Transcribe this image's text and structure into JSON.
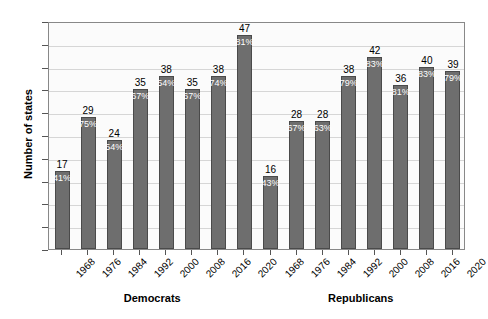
{
  "chart_data": {
    "type": "bar",
    "title": "",
    "xlabel": "",
    "ylabel": "Number of states",
    "ylim": [
      0,
      50
    ],
    "ytick_step": 5,
    "yticks": [
      0,
      5,
      10,
      15,
      20,
      25,
      30,
      35,
      40,
      45,
      50
    ],
    "grid": true,
    "legend": "none",
    "groups": [
      "Democrats",
      "Republicans"
    ],
    "categories": [
      "1968",
      "1976",
      "1984",
      "1992",
      "2000",
      "2008",
      "2016",
      "2020",
      "1968",
      "1976",
      "1984",
      "1992",
      "2000",
      "2008",
      "2016",
      "2020"
    ],
    "values": [
      17,
      29,
      24,
      35,
      38,
      35,
      38,
      47,
      16,
      28,
      28,
      38,
      42,
      36,
      40,
      39
    ],
    "data_labels_pct": [
      "41%",
      "75%",
      "54%",
      "67%",
      "54%",
      "67%",
      "74%",
      "81%",
      "43%",
      "67%",
      "63%",
      "79%",
      "83%",
      "81%",
      "83%",
      "79%"
    ],
    "bars": [
      {
        "group": "Democrats",
        "year": "1968",
        "value": 17,
        "pct": "41%"
      },
      {
        "group": "Democrats",
        "year": "1976",
        "value": 29,
        "pct": "75%"
      },
      {
        "group": "Democrats",
        "year": "1984",
        "value": 24,
        "pct": "54%"
      },
      {
        "group": "Democrats",
        "year": "1992",
        "value": 35,
        "pct": "67%"
      },
      {
        "group": "Democrats",
        "year": "2000",
        "value": 38,
        "pct": "54%"
      },
      {
        "group": "Democrats",
        "year": "2008",
        "value": 35,
        "pct": "67%"
      },
      {
        "group": "Democrats",
        "year": "2016",
        "value": 38,
        "pct": "74%"
      },
      {
        "group": "Democrats",
        "year": "2020",
        "value": 47,
        "pct": "81%"
      },
      {
        "group": "Republicans",
        "year": "1968",
        "value": 16,
        "pct": "43%"
      },
      {
        "group": "Republicans",
        "year": "1976",
        "value": 28,
        "pct": "67%"
      },
      {
        "group": "Republicans",
        "year": "1984",
        "value": 28,
        "pct": "63%"
      },
      {
        "group": "Republicans",
        "year": "1992",
        "value": 38,
        "pct": "79%"
      },
      {
        "group": "Republicans",
        "year": "2000",
        "value": 42,
        "pct": "83%"
      },
      {
        "group": "Republicans",
        "year": "2008",
        "value": 36,
        "pct": "81%"
      },
      {
        "group": "Republicans",
        "year": "2016",
        "value": 40,
        "pct": "83%"
      },
      {
        "group": "Republicans",
        "year": "2020",
        "value": 39,
        "pct": "79%"
      }
    ],
    "colors": {
      "bar_fill": "#6e6e6e",
      "bar_edge": "#4a4a4a",
      "plot_background": "#fbfbfb",
      "plot_border": "#888888",
      "gridline": "#d6d6d6",
      "text": "#000000",
      "pct_label": "#ffffff"
    }
  }
}
